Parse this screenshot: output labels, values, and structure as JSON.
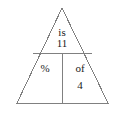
{
  "diagram": {
    "type": "percent-proportion-triangle",
    "shape": "triangle",
    "stroke_color": "#808080",
    "background_color": "#ffffff",
    "text_color": "#1a1a1a",
    "geometry": {
      "apex": [
        62,
        8
      ],
      "bottom_left": [
        17,
        103
      ],
      "bottom_right": [
        108,
        103
      ],
      "horizontal_divider_y": 53,
      "horizontal_divider_x1": 33,
      "horizontal_divider_x2": 92,
      "vertical_divider_x": 62,
      "vertical_divider_y1": 53,
      "vertical_divider_y2": 103
    },
    "cells": {
      "top": {
        "name": "is-cell",
        "label": "is",
        "value": "11"
      },
      "bottom_left": {
        "name": "percent-cell",
        "label": "%"
      },
      "bottom_right": {
        "name": "of-cell",
        "label": "of",
        "value": "4"
      }
    }
  }
}
